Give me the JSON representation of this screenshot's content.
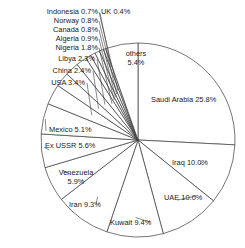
{
  "chart_data": {
    "type": "pie",
    "title": "",
    "subtitle": "",
    "xlabel": "",
    "ylabel": "",
    "legend_position": "none",
    "grid": false,
    "units": "percent",
    "start_angle_deg": 0,
    "direction": "clockwise",
    "categories": [
      "Saudi Arabia",
      "Iraq",
      "UAE",
      "Kuwait",
      "Iran",
      "Venezuela",
      "Ex USSR",
      "Mexico",
      "USA",
      "China",
      "Libya",
      "Nigeria",
      "Algeria",
      "Canada",
      "Norway",
      "Indonesia",
      "UK",
      "others"
    ],
    "values": [
      25.8,
      10.0,
      10.0,
      9.4,
      9.3,
      5.9,
      5.6,
      5.1,
      3.4,
      2.4,
      2.3,
      1.8,
      0.9,
      0.8,
      0.8,
      0.7,
      0.4,
      5.4
    ],
    "slices": [
      {
        "name": "Saudi Arabia",
        "value": 25.8,
        "label": "Saudi Arabia 25.8%"
      },
      {
        "name": "Iraq",
        "value": 10.0,
        "label": "Iraq 10.0%"
      },
      {
        "name": "UAE",
        "value": 10.0,
        "label": "UAE 10.0%"
      },
      {
        "name": "Kuwait",
        "value": 9.4,
        "label": "Kuwait 9.4%"
      },
      {
        "name": "Iran",
        "value": 9.3,
        "label": "Iran 9.3%"
      },
      {
        "name": "Venezuela",
        "value": 5.9,
        "label": "Venezuela 5.9%"
      },
      {
        "name": "Ex USSR",
        "value": 5.6,
        "label": "Ex USSR 5.6%"
      },
      {
        "name": "Mexico",
        "value": 5.1,
        "label": "Mexico 5.1%"
      },
      {
        "name": "USA",
        "value": 3.4,
        "label": "USA 3.4%"
      },
      {
        "name": "China",
        "value": 2.4,
        "label": "China 2.4%"
      },
      {
        "name": "Libya",
        "value": 2.3,
        "label": "Libya 2.3%"
      },
      {
        "name": "Nigeria",
        "value": 1.8,
        "label": "Nigeria 1.8%"
      },
      {
        "name": "Algeria",
        "value": 0.9,
        "label": "Algeria 0.9%"
      },
      {
        "name": "Canada",
        "value": 0.8,
        "label": "Canada 0.8%"
      },
      {
        "name": "Norway",
        "value": 0.8,
        "label": "Norway 0.8%"
      },
      {
        "name": "Indonesia",
        "value": 0.7,
        "label": "Indonesia 0.7%"
      },
      {
        "name": "UK",
        "value": 0.4,
        "label": "UK 0.4%"
      },
      {
        "name": "others",
        "value": 5.4,
        "label": "others 5.4%"
      }
    ],
    "colors": {
      "slice_fill": "#ffffff",
      "slice_stroke": "#3a3a3a",
      "leader_line": "#3a3a3a",
      "text": "#1a1a1a",
      "background": "#ffffff"
    }
  },
  "labels": {
    "indonesia": "Indonesia 0.7%",
    "uk": "UK 0.4%",
    "norway": "Norway 0.8%",
    "canada": "Canada 0.8%",
    "algeria": "Algeria 0.9%",
    "nigeria": "Nigeria 1.8%",
    "libya": "Libya 2.3%",
    "china": "China 2.4%",
    "usa": "USA 3.4%",
    "others_line1": "others",
    "others_line2": "5.4%",
    "saudi": "Saudi Arabia 25.8%",
    "iraq": "Iraq 10.0%",
    "uae": "UAE 10.0%",
    "kuwait": "Kuwait 9.4%",
    "iran": "Iran 9.3%",
    "venezuela_line1": "Venezuela",
    "venezuela_line2": "5.9%",
    "exussr": "Ex USSR 5.6%",
    "mexico": "Mexico 5.1%"
  }
}
